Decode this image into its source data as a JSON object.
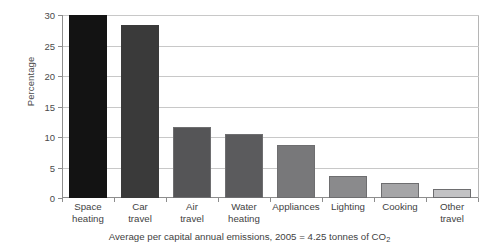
{
  "chart_data": {
    "type": "bar",
    "title": "",
    "subtitle": "",
    "xlabel": "",
    "ylabel": "Percentage",
    "ylim": [
      0,
      30
    ],
    "ytick_values": [
      0,
      5,
      10,
      15,
      20,
      25,
      30
    ],
    "ytick_labels": [
      "0",
      "5",
      "10",
      "15",
      "20",
      "25",
      "30"
    ],
    "grid": true,
    "legend": false,
    "categories": [
      "Space heating",
      "Car travel",
      "Air travel",
      "Water heating",
      "Appliances",
      "Lighting",
      "Cooking",
      "Other travel"
    ],
    "category_lines": [
      [
        "Space",
        "heating"
      ],
      [
        "Car",
        "travel"
      ],
      [
        "Air",
        "travel"
      ],
      [
        "Water",
        "heating"
      ],
      [
        "Appliances",
        ""
      ],
      [
        "Lighting",
        ""
      ],
      [
        "Cooking",
        ""
      ],
      [
        "Other",
        "travel"
      ]
    ],
    "values": [
      30.0,
      28.4,
      11.6,
      10.5,
      8.7,
      3.6,
      2.5,
      1.4
    ],
    "bar_colors": [
      "#131313",
      "#3a3a3a",
      "#555557",
      "#5b5b5d",
      "#78787a",
      "#8a8a8c",
      "#a5a5a7",
      "#c2c2c4"
    ],
    "bar_edge_color": "#6e6e70",
    "annotation": "Average per capital annual emissions, 2005 = 4.25 tonnes of CO2"
  },
  "caption": {
    "prefix": "Average per capital annual emissions, 2005 = 4.25 tonnes of CO",
    "subscript": "2"
  }
}
